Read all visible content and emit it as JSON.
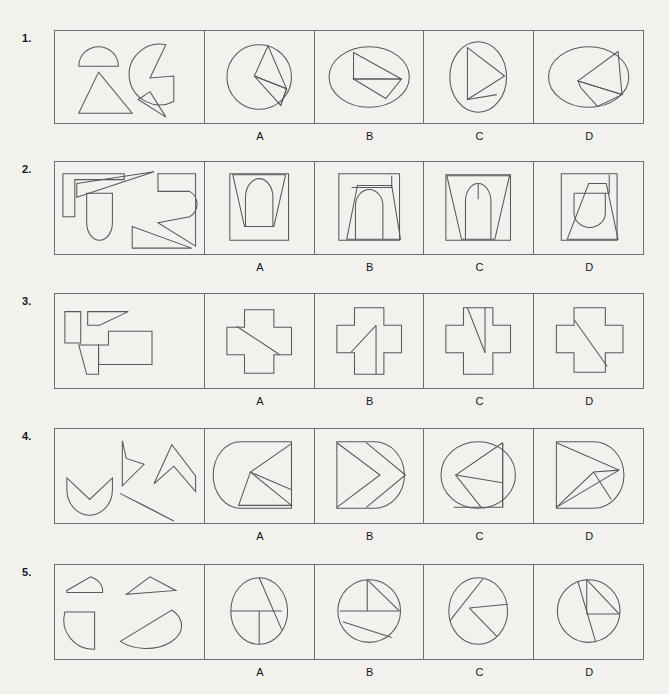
{
  "page": {
    "background_color": "#f2f1ee",
    "line_color": "#58585d",
    "border_color": "#6d6d72",
    "text_color": "#15151a"
  },
  "option_labels": [
    "A",
    "B",
    "C",
    "D"
  ],
  "questions": [
    {
      "number": "1.",
      "prompt_description": "Four pieces: a half-disc, a large pac-man style disc sector, a small triangle, and a curved wedge",
      "options": [
        {
          "label": "A",
          "description": "Circle divided by chords forming a left-pointing triangle fan"
        },
        {
          "label": "B",
          "description": "Wide ellipse with a large triangle and chord lines across it"
        },
        {
          "label": "C",
          "description": "Tall ellipse with a right-pointing triangle inside"
        },
        {
          "label": "D",
          "description": "Wide ellipse with a left-pointing triangle and a trailing quadrilateral"
        }
      ]
    },
    {
      "number": "2.",
      "prompt_description": "Four pieces: an angular hook bracket, a rounded-bottom tab, a large pointed arrow polygon, and a thin sliver triangle",
      "options": [
        {
          "label": "A",
          "description": "Square with inward tapering trapezoid and a rounded dome shape centred"
        },
        {
          "label": "B",
          "description": "Square with trapezoid, notched top band and an arch inside"
        },
        {
          "label": "C",
          "description": "Square with splayed trapezoid and a narrow dome divided by a vertical line"
        },
        {
          "label": "D",
          "description": "Square with diagonal trapezoid, a rectangle block and a U-shaped bowl"
        }
      ]
    },
    {
      "number": "3.",
      "prompt_description": "Four pieces: a small upright rectangle, a flat sheared strip, a trapezoid, and an L-shaped block",
      "options": [
        {
          "label": "A",
          "description": "Plus/cross outline with a single long diagonal line"
        },
        {
          "label": "B",
          "description": "Cross outline with a diagonal and a vertical line in the lower arm"
        },
        {
          "label": "C",
          "description": "Cross outline with a near-vertical slanted line and a vertical line"
        },
        {
          "label": "D",
          "description": "Cross outline with a long diagonal line from upper-left to lower-right"
        }
      ]
    },
    {
      "number": "4.",
      "prompt_description": "Four pieces: a crescent bowl, a right-pointing chevron, a zig-zag dart, and a thin needle triangle",
      "options": [
        {
          "label": "A",
          "description": "Rounded rectangle with a left-pointing chevron notch cut from the right"
        },
        {
          "label": "B",
          "description": "Rounded right shape containing two nested right-pointing chevrons"
        },
        {
          "label": "C",
          "description": "Ellipse with a rectangle and left-pointing arrow shapes inside"
        },
        {
          "label": "D",
          "description": "Rounded right shape with nested chevrons pointing right"
        }
      ]
    },
    {
      "number": "5.",
      "prompt_description": "Four pieces: a rounded trapezoid cap, a thin triangle, a quarter-disc, and a half-lens crescent",
      "options": [
        {
          "label": "A",
          "description": "Circle quartered by a horizontal line, a vertical line and a slanted chord"
        },
        {
          "label": "B",
          "description": "Circle with horizontal chord, vertical radius, apex triangle and a lower diagonal chord"
        },
        {
          "label": "C",
          "description": "Ellipse crossed by two long chords meeting at a centre point"
        },
        {
          "label": "D",
          "description": "Circle with vertical radius, horizontal chord and a long slanted chord"
        }
      ]
    }
  ]
}
